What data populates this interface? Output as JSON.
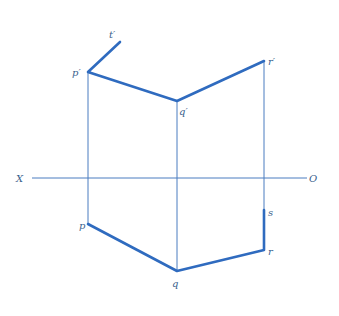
{
  "diagram": {
    "type": "orthographic-projection",
    "colors": {
      "line": "#2f6bbf",
      "projector": "#4a7cc0",
      "label": "#3a5f8c"
    },
    "reference_line": {
      "left_label": "X",
      "right_label": "O"
    },
    "points": {
      "t_prime": {
        "label": "t′",
        "x": 120,
        "y": 42
      },
      "p_prime": {
        "label": "p′",
        "x": 88,
        "y": 72
      },
      "q_prime": {
        "label": "q′",
        "x": 177,
        "y": 101
      },
      "r_prime": {
        "label": "r′",
        "x": 264,
        "y": 61
      },
      "p": {
        "label": "p",
        "x": 88,
        "y": 224
      },
      "q": {
        "label": "q",
        "x": 177,
        "y": 271
      },
      "r": {
        "label": "r",
        "x": 264,
        "y": 250
      },
      "s": {
        "label": "s",
        "x": 264,
        "y": 210
      }
    }
  }
}
